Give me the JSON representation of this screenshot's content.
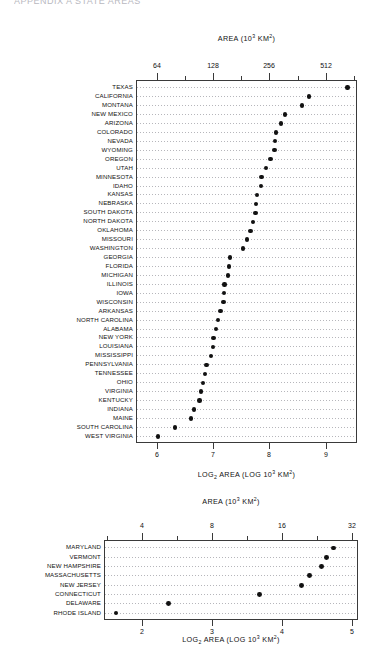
{
  "page": {
    "clipped_header": "APPENDIX A  STATE AREAS"
  },
  "chart_data": [
    {
      "id": "large-states",
      "type": "scatter",
      "title": "AREA (10³ KM²)",
      "xlabel": "LOG₂ AREA (LOG 10³ KM²)",
      "ylabel": "",
      "top_axis": {
        "label": "AREA (10³ KM²)",
        "tick_labels": [
          "64",
          "128",
          "256",
          "512"
        ],
        "tick_values": [
          6,
          7,
          8,
          9
        ]
      },
      "bottom_axis": {
        "label": "LOG₂ AREA (LOG 10³ KM²)",
        "tick_labels": [
          "6",
          "7",
          "8",
          "9"
        ],
        "tick_values": [
          6,
          7,
          8,
          9
        ]
      },
      "xlim": [
        5.62,
        9.56
      ],
      "grid": "dotted-rows",
      "categories": [
        "TEXAS",
        "CALIFORNIA",
        "MONTANA",
        "NEW MEXICO",
        "ARIZONA",
        "COLORADO",
        "NEVADA",
        "WYOMING",
        "OREGON",
        "UTAH",
        "MINNESOTA",
        "IDAHO",
        "KANSAS",
        "NEBRASKA",
        "SOUTH DAKOTA",
        "NORTH DAKOTA",
        "OKLAHOMA",
        "MISSOURI",
        "WASHINGTON",
        "GEORGIA",
        "FLORIDA",
        "MICHIGAN",
        "ILLINOIS",
        "IOWA",
        "WISCONSIN",
        "ARKANSAS",
        "NORTH CAROLINA",
        "ALABAMA",
        "NEW YORK",
        "LOUISIANA",
        "MISSISSIPPI",
        "PENNSYLVANIA",
        "TENNESSEE",
        "OHIO",
        "VIRGINIA",
        "KENTUCKY",
        "INDIANA",
        "MAINE",
        "SOUTH CAROLINA",
        "WEST VIRGINIA"
      ],
      "values": [
        9.39,
        8.7,
        8.58,
        8.28,
        8.21,
        8.12,
        8.1,
        8.09,
        8.02,
        7.94,
        7.86,
        7.85,
        7.78,
        7.76,
        7.75,
        7.71,
        7.66,
        7.6,
        7.53,
        7.3,
        7.28,
        7.26,
        7.2,
        7.19,
        7.18,
        7.13,
        7.08,
        7.05,
        7.0,
        6.99,
        6.96,
        6.88,
        6.85,
        6.81,
        6.78,
        6.75,
        6.65,
        6.6,
        6.32,
        6.01
      ]
    },
    {
      "id": "small-states",
      "type": "scatter",
      "title": "AREA (10³ KM²)",
      "xlabel": "LOG₂ AREA (LOG 10³ KM²)",
      "ylabel": "",
      "top_axis": {
        "label": "AREA (10³ KM²)",
        "tick_labels": [
          "4",
          "8",
          "16",
          "32"
        ],
        "tick_values": [
          2,
          3,
          4,
          5
        ]
      },
      "bottom_axis": {
        "label": "LOG₂ AREA (LOG 10³ KM²)",
        "tick_labels": [
          "2",
          "3",
          "4",
          "5"
        ],
        "tick_values": [
          2,
          3,
          4,
          5
        ]
      },
      "xlim": [
        1.46,
        5.08
      ],
      "grid": "dotted-rows",
      "categories": [
        "MARYLAND",
        "VERMONT",
        "NEW HAMPSHIRE",
        "MASSACHUSETTS",
        "NEW JERSEY",
        "CONNECTICUT",
        "DELAWARE",
        "RHODE ISLAND"
      ],
      "values": [
        4.73,
        4.63,
        4.56,
        4.39,
        4.28,
        3.68,
        2.38,
        1.63
      ]
    }
  ]
}
